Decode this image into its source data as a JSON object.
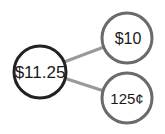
{
  "diagram": {
    "type": "number-bond",
    "whole": {
      "label": "$11.25"
    },
    "parts": [
      {
        "label": "$10"
      },
      {
        "label": "125¢"
      }
    ]
  },
  "colors": {
    "whole_stroke": "#222222",
    "part_stroke": "#6a6a6a",
    "connector": "#9a9a9a",
    "background": "#ffffff"
  }
}
